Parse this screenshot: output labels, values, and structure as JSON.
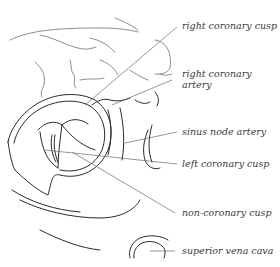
{
  "figure": {
    "line_color": "#2a2a2a",
    "leader_color": "#6a6a6a",
    "text_color": "#3a3a3a"
  },
  "labels": [
    {
      "id": "right-coronary-cusp",
      "text": "right coronary cusp"
    },
    {
      "id": "right-coronary-artery-line1",
      "text": "right coronary"
    },
    {
      "id": "right-coronary-artery-line2",
      "text": "artery"
    },
    {
      "id": "sinus-node-artery",
      "text": "sinus node artery"
    },
    {
      "id": "left-coronary-cusp",
      "text": "left coronary cusp"
    },
    {
      "id": "non-coronary-cusp",
      "text": "non-coronary cusp"
    },
    {
      "id": "superior-vena-cava",
      "text": "superior vena cava"
    }
  ]
}
